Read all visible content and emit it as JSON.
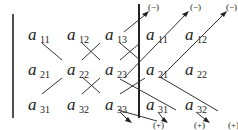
{
  "diagram": {
    "entries": [
      {
        "id": "r1c1",
        "letter": "a",
        "sub": "11",
        "x": 28,
        "y": 40
      },
      {
        "id": "r1c2",
        "letter": "a",
        "sub": "12",
        "x": 67,
        "y": 40
      },
      {
        "id": "r1c3",
        "letter": "a",
        "sub": "13",
        "x": 105,
        "y": 40
      },
      {
        "id": "r1c4",
        "letter": "a",
        "sub": "11",
        "x": 146,
        "y": 40
      },
      {
        "id": "r1c5",
        "letter": "a",
        "sub": "12",
        "x": 185,
        "y": 40
      },
      {
        "id": "r2c1",
        "letter": "a",
        "sub": "21",
        "x": 28,
        "y": 75
      },
      {
        "id": "r2c2",
        "letter": "a",
        "sub": "22",
        "x": 67,
        "y": 75
      },
      {
        "id": "r2c3",
        "letter": "a",
        "sub": "23",
        "x": 105,
        "y": 75
      },
      {
        "id": "r2c4",
        "letter": "a",
        "sub": "21",
        "x": 146,
        "y": 75
      },
      {
        "id": "r2c5",
        "letter": "a",
        "sub": "22",
        "x": 185,
        "y": 75
      },
      {
        "id": "r3c1",
        "letter": "a",
        "sub": "31",
        "x": 28,
        "y": 110
      },
      {
        "id": "r3c2",
        "letter": "a",
        "sub": "32",
        "x": 67,
        "y": 110
      },
      {
        "id": "r3c3",
        "letter": "a",
        "sub": "33",
        "x": 105,
        "y": 110
      },
      {
        "id": "r3c4",
        "letter": "a",
        "sub": "31",
        "x": 146,
        "y": 110
      },
      {
        "id": "r3c5",
        "letter": "a",
        "sub": "32",
        "x": 185,
        "y": 110
      }
    ],
    "minus_label": "(−)",
    "plus_label": "(+)",
    "minus_positions": [
      [
        146,
        10
      ],
      [
        190,
        10
      ],
      [
        228,
        10
      ]
    ],
    "plus_positions": [
      [
        151,
        127
      ],
      [
        193,
        127
      ],
      [
        230,
        127
      ]
    ]
  }
}
